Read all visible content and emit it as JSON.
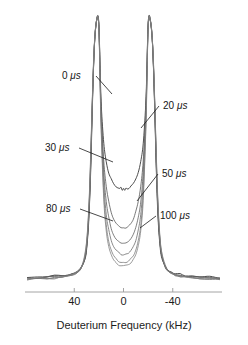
{
  "figure": {
    "background_color": "#ffffff",
    "ink_color": "#2b2b2b"
  },
  "chart_data": {
    "type": "line",
    "title": "",
    "subtitle": "",
    "xlabel": "Deuterium Frequency (kHz)",
    "ylabel": "",
    "xlim": [
      80,
      -80
    ],
    "ylim": [
      0,
      1.0
    ],
    "x_axis_inverted": true,
    "grid": false,
    "legend_position": "inline-annotations",
    "xticks": [
      40,
      0,
      -40
    ],
    "xticklabels": [
      "40",
      "0",
      "-40"
    ],
    "annotations": [
      {
        "text": "0 μs",
        "value": "0",
        "unit": "μs",
        "side": "left",
        "label_x": 62,
        "label_y": 74,
        "leader_to_x": 112,
        "leader_to_y": 94
      },
      {
        "text": "20 μs",
        "value": "20",
        "unit": "μs",
        "side": "right",
        "label_x": 163,
        "label_y": 104,
        "leader_to_x": 141,
        "leader_to_y": 128
      },
      {
        "text": "30 μs",
        "value": "30",
        "unit": "μs",
        "side": "left",
        "label_x": 45,
        "label_y": 146,
        "leader_to_x": 113,
        "leader_to_y": 162
      },
      {
        "text": "50 μs",
        "value": "50",
        "unit": "μs",
        "side": "right",
        "label_x": 162,
        "label_y": 172,
        "leader_to_x": 137,
        "leader_to_y": 201
      },
      {
        "text": "80 μs",
        "value": "80",
        "unit": "μs",
        "side": "left",
        "label_x": 46,
        "label_y": 207,
        "leader_to_x": 113,
        "leader_to_y": 221
      },
      {
        "text": "100 μs",
        "value": "100",
        "unit": "μs",
        "side": "right",
        "label_x": 160,
        "label_y": 214,
        "leader_to_x": 140,
        "leader_to_y": 228
      }
    ],
    "series": [
      {
        "name": "0 μs",
        "echo_delay_us": 0,
        "color": "#3a3a3a",
        "width": 0.9,
        "x": [
          -78,
          -70,
          -62,
          -56,
          -50,
          -46,
          -42,
          -39,
          -36,
          -34,
          -32,
          -30.5,
          -29.5,
          -28.5,
          -27.5,
          -26.5,
          -25.5,
          -24.5,
          -23.5,
          -22.5,
          -21.5,
          -21,
          -20.5,
          -20,
          -19.5,
          -19,
          -18,
          -16,
          -14,
          -12,
          -10,
          -8,
          -6,
          -4.5,
          -3,
          -2,
          -1,
          0,
          1,
          2,
          3,
          4.5,
          6,
          8,
          10,
          12,
          14,
          16,
          18,
          19,
          19.5,
          20,
          20.5,
          21,
          21.5,
          22.5,
          23.5,
          24.5,
          25.5,
          26.5,
          27.5,
          28.5,
          29.5,
          30.5,
          32,
          34,
          36,
          39,
          42,
          46,
          50,
          56,
          62,
          70,
          78
        ],
        "y": [
          0.012,
          0.014,
          0.016,
          0.018,
          0.021,
          0.024,
          0.028,
          0.033,
          0.041,
          0.052,
          0.073,
          0.1,
          0.14,
          0.2,
          0.3,
          0.44,
          0.62,
          0.78,
          0.9,
          0.96,
          0.99,
          1.0,
          0.995,
          0.97,
          0.9,
          0.8,
          0.66,
          0.52,
          0.45,
          0.41,
          0.385,
          0.37,
          0.358,
          0.352,
          0.348,
          0.352,
          0.345,
          0.35,
          0.344,
          0.351,
          0.347,
          0.351,
          0.357,
          0.369,
          0.384,
          0.409,
          0.449,
          0.519,
          0.659,
          0.8,
          0.9,
          0.97,
          0.995,
          1.0,
          0.99,
          0.96,
          0.9,
          0.78,
          0.62,
          0.44,
          0.3,
          0.2,
          0.14,
          0.1,
          0.073,
          0.052,
          0.041,
          0.033,
          0.028,
          0.024,
          0.021,
          0.018,
          0.016,
          0.014,
          0.012
        ]
      },
      {
        "name": "20 μs",
        "echo_delay_us": 20,
        "color": "#555555",
        "width": 0.8,
        "x": [
          -78,
          -70,
          -62,
          -56,
          -50,
          -46,
          -42,
          -39,
          -36,
          -34,
          -32,
          -30.5,
          -29.5,
          -28.5,
          -27.5,
          -26.5,
          -25.5,
          -24.5,
          -23.5,
          -22.5,
          -21.5,
          -21,
          -20.5,
          -20,
          -19.5,
          -19,
          -18,
          -16,
          -14,
          -12,
          -10,
          -8,
          -6,
          -4,
          -2,
          0,
          2,
          4,
          6,
          8,
          10,
          12,
          14,
          16,
          18,
          19,
          19.5,
          20,
          20.5,
          21,
          21.5,
          22.5,
          23.5,
          24.5,
          25.5,
          26.5,
          27.5,
          28.5,
          29.5,
          30.5,
          32,
          34,
          36,
          39,
          42,
          46,
          50,
          56,
          62,
          70,
          78
        ],
        "y": [
          0.01,
          0.012,
          0.014,
          0.016,
          0.019,
          0.022,
          0.026,
          0.031,
          0.04,
          0.053,
          0.077,
          0.107,
          0.15,
          0.215,
          0.315,
          0.455,
          0.63,
          0.785,
          0.9,
          0.96,
          0.99,
          1.0,
          0.993,
          0.965,
          0.89,
          0.785,
          0.63,
          0.45,
          0.355,
          0.3,
          0.262,
          0.236,
          0.219,
          0.208,
          0.202,
          0.2,
          0.202,
          0.208,
          0.219,
          0.236,
          0.262,
          0.3,
          0.355,
          0.45,
          0.63,
          0.785,
          0.89,
          0.965,
          0.993,
          1.0,
          0.99,
          0.96,
          0.9,
          0.785,
          0.63,
          0.455,
          0.315,
          0.215,
          0.15,
          0.107,
          0.077,
          0.053,
          0.04,
          0.031,
          0.026,
          0.022,
          0.019,
          0.016,
          0.014,
          0.012,
          0.01
        ]
      },
      {
        "name": "30 μs",
        "echo_delay_us": 30,
        "color": "#606060",
        "width": 0.8,
        "x": [
          -78,
          -70,
          -62,
          -56,
          -50,
          -46,
          -42,
          -39,
          -36,
          -34,
          -32,
          -30.5,
          -29.5,
          -28.5,
          -27.5,
          -26.5,
          -25.5,
          -24.5,
          -23.5,
          -22.5,
          -21.5,
          -21,
          -20.5,
          -20,
          -19.5,
          -19,
          -18,
          -16,
          -14,
          -12,
          -10,
          -8,
          -6,
          -4,
          -2,
          0,
          2,
          4,
          6,
          8,
          10,
          12,
          14,
          16,
          18,
          19,
          19.5,
          20,
          20.5,
          21,
          21.5,
          22.5,
          23.5,
          24.5,
          25.5,
          26.5,
          27.5,
          28.5,
          29.5,
          30.5,
          32,
          34,
          36,
          39,
          42,
          46,
          50,
          56,
          62,
          70,
          78
        ],
        "y": [
          0.009,
          0.011,
          0.013,
          0.015,
          0.018,
          0.021,
          0.025,
          0.03,
          0.039,
          0.053,
          0.078,
          0.11,
          0.155,
          0.222,
          0.325,
          0.468,
          0.64,
          0.79,
          0.9,
          0.962,
          0.99,
          1.0,
          0.992,
          0.962,
          0.885,
          0.775,
          0.61,
          0.41,
          0.3,
          0.24,
          0.2,
          0.175,
          0.158,
          0.148,
          0.142,
          0.14,
          0.142,
          0.148,
          0.158,
          0.175,
          0.2,
          0.24,
          0.3,
          0.41,
          0.61,
          0.775,
          0.885,
          0.962,
          0.992,
          1.0,
          0.99,
          0.962,
          0.9,
          0.79,
          0.64,
          0.468,
          0.325,
          0.222,
          0.155,
          0.11,
          0.078,
          0.053,
          0.039,
          0.03,
          0.025,
          0.021,
          0.018,
          0.015,
          0.013,
          0.011,
          0.009
        ]
      },
      {
        "name": "50 μs",
        "echo_delay_us": 50,
        "color": "#6b6b6b",
        "width": 0.8,
        "x": [
          -78,
          -70,
          -62,
          -56,
          -50,
          -46,
          -42,
          -39,
          -36,
          -34,
          -32,
          -30.5,
          -29.5,
          -28.5,
          -27.5,
          -26.5,
          -25.5,
          -24.5,
          -23.5,
          -22.5,
          -21.5,
          -21,
          -20.5,
          -20,
          -19.5,
          -19,
          -18,
          -16,
          -14,
          -12,
          -10,
          -8,
          -6,
          -4,
          -2,
          0,
          2,
          4,
          6,
          8,
          10,
          12,
          14,
          16,
          18,
          19,
          19.5,
          20,
          20.5,
          21,
          21.5,
          22.5,
          23.5,
          24.5,
          25.5,
          26.5,
          27.5,
          28.5,
          29.5,
          30.5,
          32,
          34,
          36,
          39,
          42,
          46,
          50,
          56,
          62,
          70,
          78
        ],
        "y": [
          0.008,
          0.01,
          0.012,
          0.014,
          0.017,
          0.02,
          0.024,
          0.029,
          0.038,
          0.052,
          0.078,
          0.112,
          0.158,
          0.228,
          0.333,
          0.478,
          0.648,
          0.795,
          0.902,
          0.963,
          0.99,
          1.0,
          0.991,
          0.96,
          0.88,
          0.765,
          0.59,
          0.37,
          0.252,
          0.192,
          0.155,
          0.131,
          0.116,
          0.107,
          0.102,
          0.1,
          0.102,
          0.107,
          0.116,
          0.131,
          0.155,
          0.192,
          0.252,
          0.37,
          0.59,
          0.765,
          0.88,
          0.96,
          0.991,
          1.0,
          0.99,
          0.963,
          0.902,
          0.795,
          0.648,
          0.478,
          0.333,
          0.228,
          0.158,
          0.112,
          0.078,
          0.052,
          0.038,
          0.029,
          0.024,
          0.02,
          0.017,
          0.014,
          0.012,
          0.01,
          0.008
        ]
      },
      {
        "name": "80 μs",
        "echo_delay_us": 80,
        "color": "#787878",
        "width": 0.8,
        "x": [
          -78,
          -70,
          -62,
          -56,
          -50,
          -46,
          -42,
          -39,
          -36,
          -34,
          -32,
          -30.5,
          -29.5,
          -28.5,
          -27.5,
          -26.5,
          -25.5,
          -24.5,
          -23.5,
          -22.5,
          -21.5,
          -21,
          -20.5,
          -20,
          -19.5,
          -19,
          -18,
          -16,
          -14,
          -12,
          -10,
          -8,
          -6,
          -4,
          -2,
          0,
          2,
          4,
          6,
          8,
          10,
          12,
          14,
          16,
          18,
          19,
          19.5,
          20,
          20.5,
          21,
          21.5,
          22.5,
          23.5,
          24.5,
          25.5,
          26.5,
          27.5,
          28.5,
          29.5,
          30.5,
          32,
          34,
          36,
          39,
          42,
          46,
          50,
          56,
          62,
          70,
          78
        ],
        "y": [
          0.007,
          0.009,
          0.011,
          0.013,
          0.016,
          0.019,
          0.023,
          0.029,
          0.039,
          0.055,
          0.083,
          0.12,
          0.168,
          0.24,
          0.345,
          0.49,
          0.655,
          0.8,
          0.905,
          0.964,
          0.99,
          1.0,
          0.99,
          0.957,
          0.872,
          0.75,
          0.565,
          0.33,
          0.21,
          0.152,
          0.118,
          0.097,
          0.083,
          0.075,
          0.071,
          0.07,
          0.071,
          0.075,
          0.083,
          0.097,
          0.118,
          0.152,
          0.21,
          0.33,
          0.565,
          0.75,
          0.872,
          0.957,
          0.99,
          1.0,
          0.99,
          0.964,
          0.905,
          0.8,
          0.655,
          0.49,
          0.345,
          0.24,
          0.168,
          0.12,
          0.083,
          0.055,
          0.039,
          0.029,
          0.023,
          0.019,
          0.016,
          0.013,
          0.011,
          0.009,
          0.007
        ]
      },
      {
        "name": "100 μs",
        "echo_delay_us": 100,
        "color": "#828282",
        "width": 0.8,
        "x": [
          -78,
          -70,
          -62,
          -56,
          -50,
          -46,
          -42,
          -39,
          -36,
          -34,
          -32,
          -30.5,
          -29.5,
          -28.5,
          -27.5,
          -26.5,
          -25.5,
          -24.5,
          -23.5,
          -22.5,
          -21.5,
          -21,
          -20.5,
          -20,
          -19.5,
          -19,
          -18,
          -16,
          -14,
          -12,
          -10,
          -8,
          -6,
          -4,
          -2,
          0,
          2,
          4,
          6,
          8,
          10,
          12,
          14,
          16,
          18,
          19,
          19.5,
          20,
          20.5,
          21,
          21.5,
          22.5,
          23.5,
          24.5,
          25.5,
          26.5,
          27.5,
          28.5,
          29.5,
          30.5,
          32,
          34,
          36,
          39,
          42,
          46,
          50,
          56,
          62,
          70,
          78
        ],
        "y": [
          0.006,
          0.008,
          0.01,
          0.012,
          0.015,
          0.018,
          0.023,
          0.029,
          0.04,
          0.057,
          0.087,
          0.126,
          0.176,
          0.25,
          0.355,
          0.5,
          0.662,
          0.805,
          0.907,
          0.965,
          0.99,
          1.0,
          0.989,
          0.954,
          0.866,
          0.74,
          0.548,
          0.305,
          0.188,
          0.132,
          0.1,
          0.08,
          0.067,
          0.06,
          0.056,
          0.055,
          0.056,
          0.06,
          0.067,
          0.08,
          0.1,
          0.132,
          0.188,
          0.305,
          0.548,
          0.74,
          0.866,
          0.954,
          0.989,
          1.0,
          0.99,
          0.965,
          0.907,
          0.805,
          0.662,
          0.5,
          0.355,
          0.25,
          0.176,
          0.126,
          0.087,
          0.057,
          0.04,
          0.029,
          0.023,
          0.018,
          0.015,
          0.012,
          0.01,
          0.008,
          0.006
        ]
      }
    ]
  },
  "plot_geometry": {
    "left_px": 25,
    "right_px": 222,
    "baseline_y_px": 281,
    "top_y_px": 16,
    "axis_line_y_px": 292,
    "tick_len_px": 4,
    "axis_title_y_px": 329
  }
}
